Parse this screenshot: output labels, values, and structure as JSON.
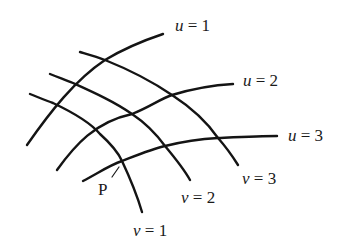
{
  "figure": {
    "stroke_color": "#141414",
    "background": "#ffffff"
  },
  "curves": {
    "u": [
      {
        "id": "u1",
        "variable": "u",
        "eq": "=",
        "value": "1",
        "path": "M27,145 C50,112 75,80 105,60 C125,48 145,40 163,34"
      },
      {
        "id": "u2",
        "variable": "u",
        "eq": "=",
        "value": "2",
        "path": "M57,170 C75,145 95,122 132,114 C150,107 160,99 172,95 C195,88 215,85 233,84"
      },
      {
        "id": "u3",
        "variable": "u",
        "eq": "=",
        "value": "3",
        "path": "M83,181 C100,172 110,165 122,161 C140,154 152,149 165,146 C185,141 200,139 218,138 C240,137 260,136 277,136"
      }
    ],
    "v": [
      {
        "id": "v1",
        "variable": "v",
        "eq": "=",
        "value": "1",
        "path": "M30,94 C40,98 47,101 53,103 C72,112 90,122 100,134 C110,143 118,152 122,161 C130,178 137,195 142,212"
      },
      {
        "id": "v2",
        "variable": "v",
        "eq": "=",
        "value": "2",
        "path": "M50,74 C60,78 66,80 73,83 C95,93 115,102 132,114 C147,124 157,135 165,146 C175,158 184,169 190,180"
      },
      {
        "id": "v3",
        "variable": "v",
        "eq": "=",
        "value": "3",
        "path": "M80,52 C90,55 97,57 105,60 C130,70 153,82 172,95 C192,108 207,122 218,138 C226,147 233,157 238,165"
      }
    ]
  },
  "labels": {
    "u1": {
      "variable": "u",
      "eq": "=",
      "value": "1",
      "x": 175,
      "y": 17
    },
    "u2": {
      "variable": "u",
      "eq": "=",
      "value": "2",
      "x": 243,
      "y": 72
    },
    "u3": {
      "variable": "u",
      "eq": "=",
      "value": "3",
      "x": 288,
      "y": 127
    },
    "v1": {
      "variable": "v",
      "eq": "=",
      "value": "1",
      "x": 133,
      "y": 222
    },
    "v2": {
      "variable": "v",
      "eq": "=",
      "value": "2",
      "x": 181,
      "y": 189
    },
    "v3": {
      "variable": "v",
      "eq": "=",
      "value": "3",
      "x": 242,
      "y": 170
    }
  },
  "point": {
    "label": "P",
    "x": 98,
    "y": 181,
    "arrow": "M112,177 L119,167"
  }
}
